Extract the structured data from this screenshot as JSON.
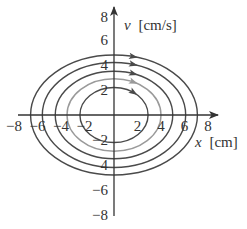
{
  "chart_data": {
    "type": "phase-portrait",
    "title": "",
    "xlabel": "x [cm]",
    "ylabel": "v [cm/s]",
    "xlabel_var": "x",
    "xlabel_unit": "[cm]",
    "ylabel_var": "v",
    "ylabel_unit": "[cm/s]",
    "xlim": [
      -8,
      8
    ],
    "ylim": [
      -8,
      8
    ],
    "x_ticks": [
      -8,
      -6,
      -4,
      -2,
      2,
      4,
      6,
      8
    ],
    "y_ticks": [
      8,
      6,
      4,
      2,
      -2,
      -4,
      -6,
      -8
    ],
    "x_tick_labels": [
      "−8",
      "−6",
      "−4",
      "−2",
      "2",
      "4",
      "6",
      "8"
    ],
    "y_tick_labels": [
      "8",
      "6",
      "4",
      "2",
      "−2",
      "4",
      "−6",
      "−8"
    ],
    "grid": false,
    "legend": "none",
    "series": [
      {
        "name": "orbit-1",
        "x_amplitude": 2.9,
        "v_amplitude": 2.2,
        "color": "#4a4a4a",
        "direction": "clockwise"
      },
      {
        "name": "orbit-2",
        "x_amplitude": 4.0,
        "v_amplitude": 2.9,
        "color": "#9a9a9a",
        "direction": "clockwise"
      },
      {
        "name": "orbit-3",
        "x_amplitude": 5.0,
        "v_amplitude": 3.5,
        "color": "#4a4a4a",
        "direction": "clockwise"
      },
      {
        "name": "orbit-4",
        "x_amplitude": 6.1,
        "v_amplitude": 4.2,
        "color": "#4a4a4a",
        "direction": "clockwise"
      },
      {
        "name": "orbit-5",
        "x_amplitude": 7.1,
        "v_amplitude": 4.8,
        "color": "#4a4a4a",
        "direction": "clockwise"
      }
    ]
  },
  "colors": {
    "axis": "#333333",
    "dark_orbit": "#4a4a4a",
    "light_orbit": "#9a9a9a",
    "background": "#ffffff"
  }
}
